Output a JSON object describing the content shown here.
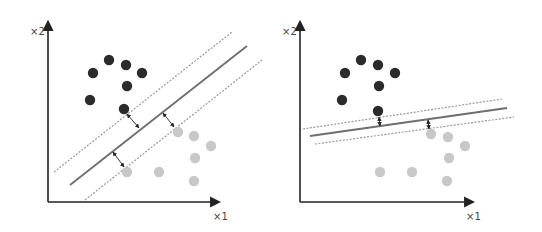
{
  "colors": {
    "class_a": "#2b2b2b",
    "class_b": "#c8c8c8",
    "axis": "#222222",
    "hyperplane": "#6e6e6e",
    "margin": "#9a9a9a",
    "arrow": "#222222"
  },
  "panels": [
    {
      "name": "wide-margin",
      "x_label": "×1",
      "y_label": "×2",
      "axis": {
        "origin": [
          48,
          202
        ],
        "y_top": 18,
        "x_right": 223
      },
      "x_label_pos": [
        213,
        220
      ],
      "y_label_pos": [
        30,
        35
      ],
      "class_a_points": [
        [
          93,
          73
        ],
        [
          109,
          60
        ],
        [
          126,
          65
        ],
        [
          142,
          73
        ],
        [
          127,
          86
        ],
        [
          90,
          100
        ],
        [
          124,
          109
        ]
      ],
      "class_b_points": [
        [
          127,
          172
        ],
        [
          159,
          172
        ],
        [
          178,
          132
        ],
        [
          194,
          136
        ],
        [
          211,
          146
        ],
        [
          195,
          158
        ],
        [
          194,
          181
        ]
      ],
      "hyperplane": [
        [
          70,
          185
        ],
        [
          247,
          46
        ]
      ],
      "margin_upper": [
        [
          54,
          172
        ],
        [
          232,
          32
        ]
      ],
      "margin_lower": [
        [
          85,
          200
        ],
        [
          262,
          60
        ]
      ],
      "arrows": [
        [
          [
            127,
            114
          ],
          [
            139,
            128
          ]
        ],
        [
          [
            163,
            113
          ],
          [
            174,
            127
          ]
        ],
        [
          [
            113,
            152
          ],
          [
            124,
            167
          ]
        ]
      ]
    },
    {
      "name": "narrow-margin",
      "x_label": "×1",
      "y_label": "×2",
      "axis": {
        "origin": [
          300,
          202
        ],
        "y_top": 18,
        "x_right": 477
      },
      "x_label_pos": [
        466,
        220
      ],
      "y_label_pos": [
        282,
        35
      ],
      "class_a_points": [
        [
          345,
          73
        ],
        [
          361,
          60
        ],
        [
          378,
          65
        ],
        [
          395,
          73
        ],
        [
          379,
          86
        ],
        [
          342,
          100
        ],
        [
          378,
          111
        ]
      ],
      "class_b_points": [
        [
          380,
          172
        ],
        [
          412,
          172
        ],
        [
          431,
          134
        ],
        [
          448,
          137
        ],
        [
          465,
          146
        ],
        [
          449,
          158
        ],
        [
          447,
          181
        ]
      ],
      "hyperplane": [
        [
          310,
          136
        ],
        [
          507,
          108
        ]
      ],
      "margin_upper": [
        [
          303,
          129
        ],
        [
          502,
          99
        ]
      ],
      "margin_lower": [
        [
          315,
          144
        ],
        [
          514,
          117
        ]
      ],
      "arrows": [
        [
          [
            379,
            117
          ],
          [
            380,
            126
          ]
        ],
        [
          [
            428,
            120
          ],
          [
            429,
            129
          ]
        ]
      ]
    }
  ]
}
